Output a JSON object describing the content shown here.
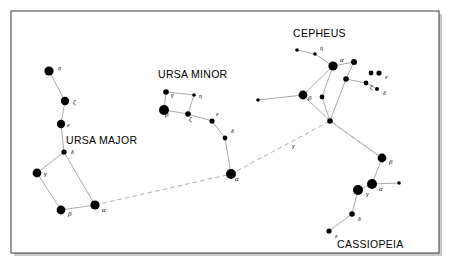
{
  "figure": {
    "background_color": "#ffffff",
    "frame_color": "#4a4a4a",
    "star_color": "#000000",
    "line_color": "#9a9a9a",
    "pointer_line_color": "#a8a8a8"
  },
  "constellation_labels": [
    {
      "id": "ursa-major",
      "text": "URSA MAJOR",
      "x": 66,
      "y": 144
    },
    {
      "id": "ursa-minor",
      "text": "URSA MINOR",
      "x": 158,
      "y": 78
    },
    {
      "id": "cepheus",
      "text": "CEPHEUS",
      "x": 293,
      "y": 37
    },
    {
      "id": "cassiopeia",
      "text": "CASSIOPEIA",
      "x": 337,
      "y": 248
    }
  ],
  "star_labels": [
    {
      "id": "uma-eta",
      "text": "η",
      "x": 58,
      "y": 70
    },
    {
      "id": "uma-zeta",
      "text": "ζ",
      "x": 73,
      "y": 104
    },
    {
      "id": "uma-epsilon",
      "text": "ε",
      "x": 67,
      "y": 127
    },
    {
      "id": "uma-delta",
      "text": "δ",
      "x": 71,
      "y": 154
    },
    {
      "id": "uma-gamma",
      "text": "γ",
      "x": 44,
      "y": 176
    },
    {
      "id": "uma-beta",
      "text": "β",
      "x": 68,
      "y": 216
    },
    {
      "id": "uma-alpha",
      "text": "α",
      "x": 102,
      "y": 212
    },
    {
      "id": "umi-gamma",
      "text": "γ",
      "x": 171,
      "y": 97
    },
    {
      "id": "umi-beta",
      "text": "β",
      "x": 165,
      "y": 117
    },
    {
      "id": "umi-eta",
      "text": "η",
      "x": 199,
      "y": 98
    },
    {
      "id": "umi-zeta",
      "text": "ζ",
      "x": 189,
      "y": 121
    },
    {
      "id": "umi-epsilon",
      "text": "ε",
      "x": 216,
      "y": 116
    },
    {
      "id": "umi-delta",
      "text": "δ",
      "x": 231,
      "y": 133
    },
    {
      "id": "umi-alpha",
      "text": "α",
      "x": 235,
      "y": 181
    },
    {
      "id": "cep-eta",
      "text": "η",
      "x": 320,
      "y": 50
    },
    {
      "id": "cep-alpha",
      "text": "α",
      "x": 340,
      "y": 62
    },
    {
      "id": "cep-beta",
      "text": "β",
      "x": 308,
      "y": 100
    },
    {
      "id": "cep-zeta",
      "text": "ζ",
      "x": 370,
      "y": 89
    },
    {
      "id": "cep-epsilon",
      "text": "ε",
      "x": 385,
      "y": 79
    },
    {
      "id": "cep-delta",
      "text": "δ",
      "x": 383,
      "y": 95
    },
    {
      "id": "cep-gamma",
      "text": "γ",
      "x": 292,
      "y": 148
    },
    {
      "id": "cas-beta",
      "text": "β",
      "x": 389,
      "y": 164
    },
    {
      "id": "cas-alpha",
      "text": "α",
      "x": 379,
      "y": 191
    },
    {
      "id": "cas-gamma",
      "text": "γ",
      "x": 366,
      "y": 196
    },
    {
      "id": "cas-delta",
      "text": "δ",
      "x": 358,
      "y": 221
    },
    {
      "id": "cas-epsilon",
      "text": "ε",
      "x": 335,
      "y": 238
    }
  ],
  "chart_data": {
    "type": "scatter",
    "xlabel": "",
    "ylabel": "",
    "xlim": [
      0,
      450
    ],
    "ylim": [
      0,
      267
    ],
    "grid": false,
    "legend": "none",
    "series": [
      {
        "name": "Ursa Major",
        "stars": [
          {
            "label": "η",
            "x": 49,
            "y": 71,
            "r": 4.6
          },
          {
            "label": "ζ",
            "x": 65,
            "y": 101,
            "r": 4.2
          },
          {
            "label": "ε",
            "x": 61,
            "y": 124,
            "r": 4.2
          },
          {
            "label": "δ",
            "x": 64,
            "y": 152,
            "r": 2.6
          },
          {
            "label": "γ",
            "x": 37,
            "y": 173,
            "r": 4.4
          },
          {
            "label": "β",
            "x": 61,
            "y": 210,
            "r": 4.4
          },
          {
            "label": "α",
            "x": 95,
            "y": 205,
            "r": 4.6
          }
        ],
        "lines": [
          [
            49,
            71,
            65,
            101
          ],
          [
            65,
            101,
            61,
            124
          ],
          [
            61,
            124,
            64,
            152
          ],
          [
            64,
            152,
            37,
            173
          ],
          [
            37,
            173,
            61,
            210
          ],
          [
            61,
            210,
            95,
            205
          ],
          [
            95,
            205,
            64,
            152
          ]
        ]
      },
      {
        "name": "Ursa Minor",
        "stars": [
          {
            "label": "γ",
            "x": 166,
            "y": 92,
            "r": 2.8
          },
          {
            "label": "β",
            "x": 164,
            "y": 110,
            "r": 5.0
          },
          {
            "label": "η",
            "x": 194,
            "y": 95,
            "r": 1.8
          },
          {
            "label": "ζ",
            "x": 188,
            "y": 114,
            "r": 2.8
          },
          {
            "label": "ε",
            "x": 212,
            "y": 121,
            "r": 2.6
          },
          {
            "label": "δ",
            "x": 225,
            "y": 138,
            "r": 2.4
          },
          {
            "label": "α",
            "x": 231,
            "y": 174,
            "r": 5.0
          }
        ],
        "lines": [
          [
            166,
            92,
            164,
            110
          ],
          [
            164,
            110,
            188,
            114
          ],
          [
            188,
            114,
            194,
            95
          ],
          [
            194,
            95,
            166,
            92
          ],
          [
            188,
            114,
            212,
            121
          ],
          [
            212,
            121,
            225,
            138
          ],
          [
            225,
            138,
            231,
            174
          ]
        ]
      },
      {
        "name": "Cepheus",
        "stars": [
          {
            "label": "",
            "x": 297,
            "y": 50,
            "r": 1.8
          },
          {
            "label": "η",
            "x": 315,
            "y": 54,
            "r": 1.8
          },
          {
            "label": "α",
            "x": 333,
            "y": 66,
            "r": 4.6
          },
          {
            "label": "",
            "x": 354,
            "y": 62,
            "r": 3.0
          },
          {
            "label": "",
            "x": 346,
            "y": 79,
            "r": 2.8
          },
          {
            "label": "β",
            "x": 303,
            "y": 95,
            "r": 4.4
          },
          {
            "label": "ζ",
            "x": 366,
            "y": 83,
            "r": 2.4
          },
          {
            "label": "ε",
            "x": 379,
            "y": 73,
            "r": 2.6
          },
          {
            "label": "",
            "x": 371,
            "y": 73,
            "r": 2.4
          },
          {
            "label": "δ",
            "x": 377,
            "y": 89,
            "r": 2.0
          },
          {
            "label": "",
            "x": 322,
            "y": 97,
            "r": 2.4
          },
          {
            "label": "γ",
            "x": 330,
            "y": 121,
            "r": 2.8
          },
          {
            "label": "",
            "x": 258,
            "y": 100,
            "r": 1.8
          }
        ],
        "lines": [
          [
            297,
            50,
            315,
            54
          ],
          [
            315,
            54,
            333,
            66
          ],
          [
            333,
            66,
            354,
            62
          ],
          [
            354,
            62,
            346,
            79
          ],
          [
            346,
            79,
            366,
            83
          ],
          [
            366,
            83,
            377,
            89
          ],
          [
            333,
            66,
            303,
            95
          ],
          [
            303,
            95,
            330,
            121
          ],
          [
            330,
            121,
            346,
            79
          ],
          [
            303,
            95,
            258,
            100
          ],
          [
            322,
            97,
            333,
            66
          ],
          [
            322,
            97,
            330,
            121
          ]
        ]
      },
      {
        "name": "Cassiopeia",
        "stars": [
          {
            "label": "β",
            "x": 382,
            "y": 158,
            "r": 4.4
          },
          {
            "label": "α",
            "x": 372,
            "y": 184,
            "r": 5.0
          },
          {
            "label": "",
            "x": 399,
            "y": 183,
            "r": 1.8
          },
          {
            "label": "γ",
            "x": 358,
            "y": 190,
            "r": 5.0
          },
          {
            "label": "δ",
            "x": 352,
            "y": 214,
            "r": 2.8
          },
          {
            "label": "ε",
            "x": 329,
            "y": 231,
            "r": 2.6
          }
        ],
        "lines": [
          [
            382,
            158,
            372,
            184
          ],
          [
            372,
            184,
            399,
            183
          ],
          [
            372,
            184,
            358,
            190
          ],
          [
            358,
            190,
            352,
            214
          ],
          [
            352,
            214,
            329,
            231
          ],
          [
            382,
            158,
            330,
            121
          ]
        ]
      }
    ],
    "pointer_lines": [
      {
        "name": "pointer-to-polaris",
        "points": [
          95,
          205,
          231,
          174,
          330,
          121,
          382,
          158
        ],
        "style": "dashed"
      }
    ]
  }
}
